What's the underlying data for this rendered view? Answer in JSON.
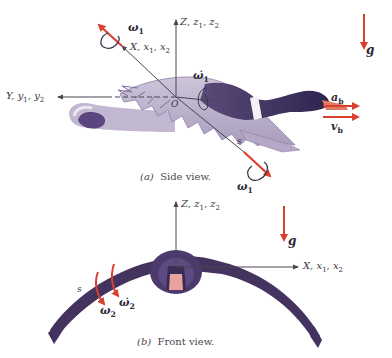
{
  "side_view": {
    "caption_letter": "(a)",
    "caption_text": "Side view.",
    "axes": {
      "x_label": "X, x",
      "x_subs": [
        "1",
        "2"
      ],
      "y_label": "Y, y",
      "y_subs": [
        "1",
        "2"
      ],
      "z_label": "Z, z",
      "z_subs": [
        "1",
        "2"
      ],
      "origin": "O"
    },
    "vectors": {
      "omega1_top": "ω",
      "omega1_top_sub": "1",
      "omega1_dot_center": "ω̇",
      "omega1_dot_center_sub": "1",
      "omega1_bottom": "ω",
      "omega1_bottom_sub": "1",
      "a_b": "a",
      "a_b_sub": "b",
      "v_b": "v",
      "v_b_sub": "b",
      "g": "g",
      "s": "s"
    }
  },
  "front_view": {
    "caption_letter": "(b)",
    "caption_text": "Front view.",
    "axes": {
      "x_label": "X, x",
      "x_subs": [
        "1",
        "2"
      ],
      "z_label": "Z, z",
      "z_subs": [
        "1",
        "2"
      ]
    },
    "vectors": {
      "omega2": "ω",
      "omega2_sub": "2",
      "omega2_dot": "ω̇",
      "omega2_dot_sub": "2",
      "g": "g",
      "s": "s"
    }
  },
  "colors": {
    "vector_red": "#d9412e",
    "axis_line": "#4a4452",
    "wing_light": "#b8aec8",
    "body_dark": "#3e2f5e",
    "beak": "#e07a63"
  }
}
